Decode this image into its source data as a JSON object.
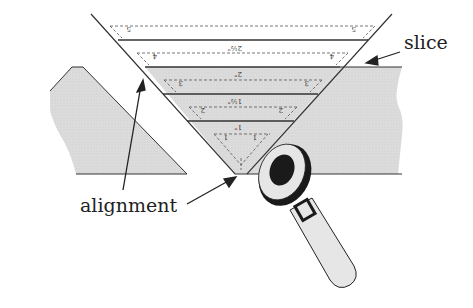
{
  "diagram": {
    "labels": {
      "slice": "slice",
      "alignment": "alignment"
    },
    "layers": [
      {
        "mark": "1\"",
        "arrow_label": "1\"",
        "side_label": "1",
        "full_label": "1″"
      },
      {
        "mark": "1 1/2\"",
        "arrow_label": "1½\"",
        "side_label": "2"
      },
      {
        "mark": "2\"",
        "arrow_label": "2\"",
        "side_label": "3"
      },
      {
        "mark": "2 1/2\"",
        "arrow_label": "2½\"",
        "side_label": "4"
      },
      {
        "mark": "top",
        "side_label": "5"
      }
    ],
    "colors": {
      "board_fill": "#d9d9d9",
      "line": "#333333",
      "tool_dark": "#1a1a1a",
      "tool_light": "#e6e6e6"
    }
  }
}
